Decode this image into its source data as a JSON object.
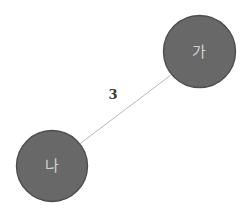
{
  "canvas": {
    "width": 245,
    "height": 214,
    "background": "#ffffff"
  },
  "graph": {
    "node_fill": "#686868",
    "node_stroke": "#4e4e4e",
    "node_label_color": "#d2d2d2",
    "edge_color": "#b9b9b9",
    "edge_label_color": "#3a3a3a",
    "nodes": [
      {
        "id": "ga",
        "label": "가",
        "cx": 199.5,
        "cy": 51.5,
        "r": 36.0
      },
      {
        "id": "na",
        "label": "나",
        "cx": 52.0,
        "cy": 166.0,
        "r": 35.5
      }
    ],
    "edges": [
      {
        "id": "ga-na",
        "source": "ga",
        "target": "na",
        "label": "3",
        "x1": 171.5,
        "y1": 74.6,
        "x2": 79.9,
        "y2": 143.8,
        "label_x": 113.0,
        "label_y": 94.0
      }
    ]
  }
}
